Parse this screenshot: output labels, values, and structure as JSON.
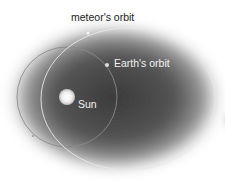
{
  "diagram": {
    "labels": {
      "meteor_orbit": "meteor's orbit",
      "earth_orbit": "Earth's orbit",
      "sun": "Sun"
    },
    "colors": {
      "background": "#ffffff",
      "glow": "#3a3a3a",
      "meteor_orbit_line": "#e8e8e8",
      "earth_orbit_line": "#8a8a8a",
      "sun": "#ffffff",
      "label_dark": "#222222",
      "label_light": "#f2f2f2"
    }
  }
}
